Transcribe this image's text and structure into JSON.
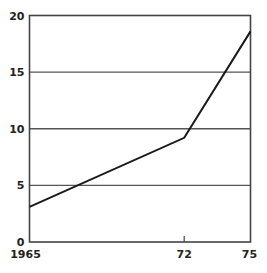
{
  "chart_data": {
    "type": "line",
    "title": "",
    "xlabel": "",
    "ylabel": "",
    "x": [
      1965,
      1972,
      1975
    ],
    "series": [
      {
        "name": "series-1",
        "values": [
          3.1,
          9.2,
          18.6
        ],
        "color": "#1a1a1a"
      }
    ],
    "x_tick_labels": [
      "1965",
      "72",
      "75"
    ],
    "y_ticks": [
      0,
      5,
      10,
      15,
      20
    ],
    "y_tick_labels": [
      "0",
      "5",
      "10",
      "15",
      "20"
    ],
    "xlim": [
      1965,
      1975
    ],
    "ylim": [
      0,
      20
    ],
    "grid": {
      "horizontal": true,
      "vertical": false
    },
    "legend": "none"
  }
}
